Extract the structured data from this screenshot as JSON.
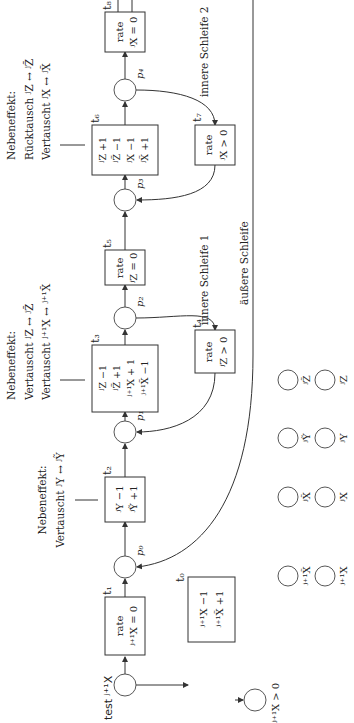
{
  "diagram": {
    "orientation": "rotated-90-ccw",
    "transitions": {
      "t0": {
        "label": "t₀",
        "lines": [
          "ʲ⁺¹X −1",
          "ʲ⁺¹X̃ +1"
        ]
      },
      "t1": {
        "label": "t₁",
        "lines": [
          "rate",
          "ʲ⁺¹X = 0"
        ]
      },
      "t2": {
        "label": "t₂",
        "lines": [
          "ʲY −1",
          "ʲỸ +1"
        ]
      },
      "t3": {
        "label": "t₃",
        "lines": [
          "ʲZ −1",
          "ʲZ̃ +1",
          "ʲ⁺¹X + 1",
          "ʲ⁺¹X̃ −1"
        ]
      },
      "t4": {
        "label": "t₄",
        "lines": [
          "rate",
          "ʲZ > 0"
        ]
      },
      "t5": {
        "label": "t₅",
        "lines": [
          "rate",
          "ʲZ = 0"
        ]
      },
      "t6": {
        "label": "t₆",
        "lines": [
          "ʲZ +1",
          "ʲZ̃ −1",
          "ʲX −1",
          "ʲX̃ +1"
        ]
      },
      "t7": {
        "label": "t₇",
        "lines": [
          "rate",
          "ʲX > 0"
        ]
      },
      "t8": {
        "label": "t₈",
        "lines": [
          "rate",
          "ʲX = 0"
        ]
      }
    },
    "places": {
      "test": "test ʲ⁺¹X",
      "p0": "p₀",
      "p1": "p₁",
      "p2": "p₂",
      "p3": "p₃",
      "p4": "p₄",
      "result": "ʲ⁺¹X > 0"
    },
    "annotations": {
      "t2_side": [
        "Nebeneffekt:",
        "Vertauscht ʲY ↔ ʲỸ"
      ],
      "t3_side": [
        "Nebeneffekt:",
        "Vertauscht ʲZ ↔ ʲZ̃",
        "Vertauscht ʲ⁺¹X ↔ ʲ⁺¹X̃"
      ],
      "t6_side": [
        "Nebeneffekt:",
        "Rücktausch ʲZ ↔ ʲZ̃",
        "Vertauscht ʲX ↔ ʲX̃"
      ]
    },
    "loops": {
      "inner1": "innere Schleife 1",
      "inner2": "innere Schleife 2",
      "outer": "äußere Schleife"
    },
    "state_places": {
      "tilde_row": [
        "ʲ⁺¹X̃",
        "ʲX̃",
        "ʲỸ",
        "ʲZ̃"
      ],
      "plain_row": [
        "ʲ⁺¹X",
        "ʲX",
        "ʲY",
        "ʲZ"
      ]
    }
  }
}
